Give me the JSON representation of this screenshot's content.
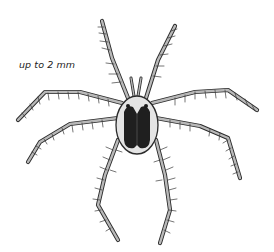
{
  "illustration": {
    "subject": "water mite",
    "scale_label": "up to 2 mm",
    "colors": {
      "outline": "#2b2b2b",
      "leg_fill": "#b9b9b9",
      "body_fill": "#e4e4e4",
      "dorsal_plate": "#1f1f1f",
      "background": "#ffffff"
    }
  }
}
